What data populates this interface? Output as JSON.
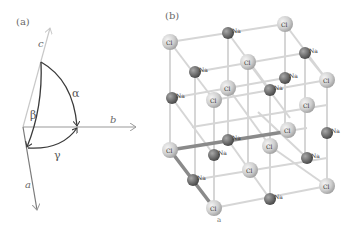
{
  "panel_a": {
    "label": "(a)",
    "axes": {
      "a": "a",
      "b": "b",
      "c": "c"
    },
    "angles": {
      "alpha": "α",
      "beta": "β",
      "gamma": "γ"
    },
    "colors": {
      "axis": "#9a9a9a",
      "axis_c": "#c8c8c8",
      "arc": "#3a3a3a"
    }
  },
  "panel_b": {
    "label": "(b)",
    "axis_label": "a",
    "atom_labels": {
      "cl": "Cl",
      "na": "Na"
    },
    "colors": {
      "cl": "#c9c9c9",
      "na": "#6e6e6e",
      "bond": "#d4d4d4",
      "highlight_bond": "#8a8a8a"
    }
  }
}
